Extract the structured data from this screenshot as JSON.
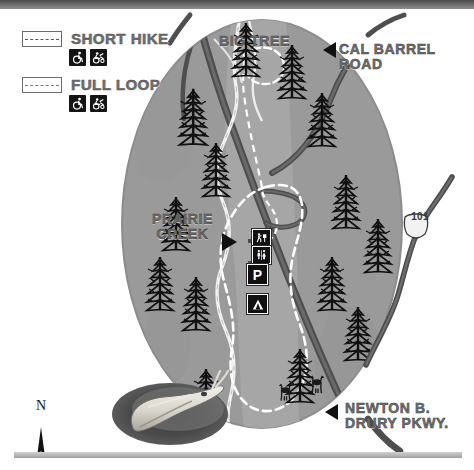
{
  "map": {
    "title": "Prairie Creek Redwoods trail map",
    "background_color": "#ffffff",
    "forest_color": "#9a9a9a",
    "meadow_color": "#a8a8a8",
    "road_color": "#545454",
    "creek_color": "#e8e8e8",
    "trail_color": "#ffffff"
  },
  "legend": {
    "items": [
      {
        "id": "short-hike",
        "label": "SHORT HIKE",
        "line_style": "dashed",
        "swatch_fill": "#ffffff",
        "icons": [
          {
            "name": "wheelchair-accessible-icon",
            "label": "wheelchair accessible"
          },
          {
            "name": "assisted-wheelchair-icon",
            "label": "assisted access"
          }
        ]
      },
      {
        "id": "full-loop",
        "label": "FULL LOOP",
        "line_style": "dashed",
        "swatch_fill": "#ffffff",
        "icons": [
          {
            "name": "wheelchair-accessible-icon",
            "label": "wheelchair accessible"
          },
          {
            "name": "assisted-wheelchair-icon",
            "label": "assisted access"
          }
        ]
      }
    ]
  },
  "labels": {
    "big_tree": "BIG TREE",
    "cal_barrel_road": "CAL BARREL\nROAD",
    "prairie_creek": "PRAIRIE\nCREEK",
    "newton_drury": "NEWTON B.\nDRURY PKWY.",
    "highway_shield": "101",
    "north": "N"
  },
  "point_icons": [
    {
      "name": "trailhead-icon",
      "label": "Trailhead / hiking"
    },
    {
      "name": "restroom-icon",
      "label": "Restrooms"
    },
    {
      "name": "parking-icon",
      "label": "P"
    },
    {
      "name": "campground-icon",
      "label": "Campground"
    }
  ],
  "inset": {
    "name": "banana-slug-photo",
    "caption": ""
  },
  "wildlife": {
    "name": "elk-herd-icons",
    "count": 3
  }
}
